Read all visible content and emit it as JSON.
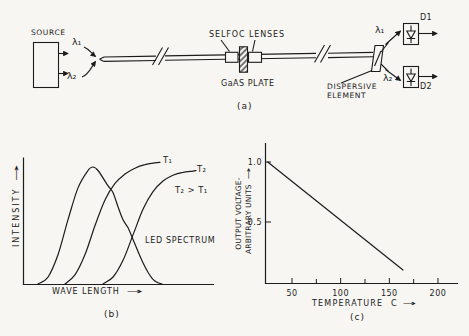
{
  "panel_a": {
    "caption": "(a)",
    "source_label": "SOURCE",
    "lambda_1": "λ₁",
    "lambda_2": "λ₂",
    "selfoc_lenses_label": "SELFOC LENSES",
    "gaas_plate_label": "GaAS PLATE",
    "dispersive_element_label_line1": "DISPERSIVE",
    "dispersive_element_label_line2": "ELEMENT",
    "detector_1_label": "D1",
    "detector_2_label": "D2"
  },
  "panel_b": {
    "caption": "(b)"
  },
  "panel_c": {
    "caption": "(c)",
    "ylabel_line1": "OUTPUT VOLTAGE-",
    "ylabel_line2": "ARBITRARY UNITS"
  },
  "icons": {
    "right_arrow": "→"
  },
  "line_color": "#1c1c1c",
  "chart_data": [
    {
      "id": "b",
      "type": "line",
      "title": "",
      "xlabel": "WAVE LENGTH",
      "ylabel": "INTENSITY",
      "xlim": [
        0,
        100
      ],
      "ylim": [
        0,
        1.1
      ],
      "grid": false,
      "annotations": [
        "T₂ > T₁"
      ],
      "x_unit": "arbitrary",
      "y_unit": "arbitrary",
      "series": [
        {
          "name": "LED SPECTRUM",
          "points": [
            [
              7.9,
              0
            ],
            [
              13.2,
              0.06
            ],
            [
              18.4,
              0.25
            ],
            [
              23.7,
              0.55
            ],
            [
              28.9,
              0.82
            ],
            [
              34.2,
              0.97
            ],
            [
              36.8,
              1.0
            ],
            [
              39.5,
              0.97
            ],
            [
              44.7,
              0.84
            ],
            [
              47.4,
              0.78
            ],
            [
              50,
              0.66
            ],
            [
              52.6,
              0.55
            ],
            [
              55.3,
              0.48
            ],
            [
              57.9,
              0.38
            ],
            [
              60.5,
              0.28
            ],
            [
              63.2,
              0.18
            ],
            [
              65.8,
              0.1
            ],
            [
              68.4,
              0.04
            ],
            [
              71.1,
              0.01
            ],
            [
              73.2,
              0
            ]
          ]
        },
        {
          "name": "T₁",
          "points": [
            [
              22.1,
              0
            ],
            [
              27.4,
              0.08
            ],
            [
              32.6,
              0.25
            ],
            [
              37.9,
              0.5
            ],
            [
              43.2,
              0.72
            ],
            [
              48.4,
              0.86
            ],
            [
              53.7,
              0.94
            ],
            [
              58.9,
              0.99
            ],
            [
              64.2,
              1.02
            ],
            [
              69.5,
              1.035
            ],
            [
              72.1,
              1.04
            ]
          ]
        },
        {
          "name": "T₂",
          "points": [
            [
              42.1,
              0
            ],
            [
              47.4,
              0.06
            ],
            [
              52.6,
              0.2
            ],
            [
              57.9,
              0.42
            ],
            [
              63.2,
              0.64
            ],
            [
              68.4,
              0.79
            ],
            [
              73.7,
              0.88
            ],
            [
              78.9,
              0.93
            ],
            [
              84.2,
              0.955
            ],
            [
              89.5,
              0.965
            ],
            [
              91.1,
              0.97
            ]
          ]
        }
      ]
    },
    {
      "id": "c",
      "type": "line",
      "title": "",
      "xlabel": "TEMPERATURE C",
      "ylabel": "OUTPUT VOLTAGE-ARBITRARY UNITS",
      "xlim": [
        22,
        220
      ],
      "ylim": [
        0,
        1.17
      ],
      "grid": false,
      "xticks": [
        50,
        100,
        150,
        200
      ],
      "xticks_minor": [
        75,
        125,
        175
      ],
      "yticks": [
        1.0,
        0.5
      ],
      "ytick_labels": [
        "1.0",
        "0.5"
      ],
      "series": [
        {
          "name": "output voltage",
          "points": [
            [
              25,
              1.0
            ],
            [
              164,
              0.1
            ]
          ]
        }
      ]
    }
  ]
}
